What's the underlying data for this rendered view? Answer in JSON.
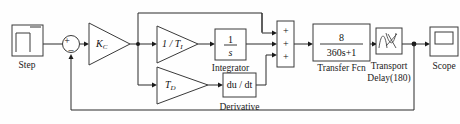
{
  "diagram": {
    "colors": {
      "wire": "#2b2b2b",
      "block_stroke": "#3a3a3a",
      "background": "#fefefe",
      "text": "#111111"
    },
    "blocks": {
      "step": {
        "label": "Step",
        "icon": "step-signal-icon"
      },
      "sum_error": {
        "icon": "circle-sum-icon",
        "input_plus": "+",
        "input_minus": "–"
      },
      "gain_kc": {
        "symbol": "K",
        "subscript": "C",
        "icon": "triangle-gain-icon"
      },
      "gain_inv_ti": {
        "symbol": "1 / T",
        "subscript": "I",
        "icon": "triangle-gain-icon"
      },
      "integrator": {
        "numerator": "1",
        "denominator": "s",
        "label": "Integrator"
      },
      "gain_td": {
        "symbol": "T",
        "subscript": "D",
        "icon": "triangle-gain-icon"
      },
      "derivative": {
        "expression_num": "du",
        "expression_den": "dt",
        "expression": "du / dt",
        "label": "Derivative"
      },
      "sum_three": {
        "icon": "rect-sum-icon",
        "signs": [
          "+",
          "+",
          "+"
        ]
      },
      "transfer_fcn": {
        "numerator": "8",
        "denominator": "360s+1",
        "label": "Transfer Fcn"
      },
      "transport_delay": {
        "label_line1": "Transport",
        "label_line2": "Delay(180)",
        "icon": "transport-delay-icon"
      },
      "scope": {
        "label": "Scope",
        "icon": "scope-screen-icon"
      }
    }
  }
}
